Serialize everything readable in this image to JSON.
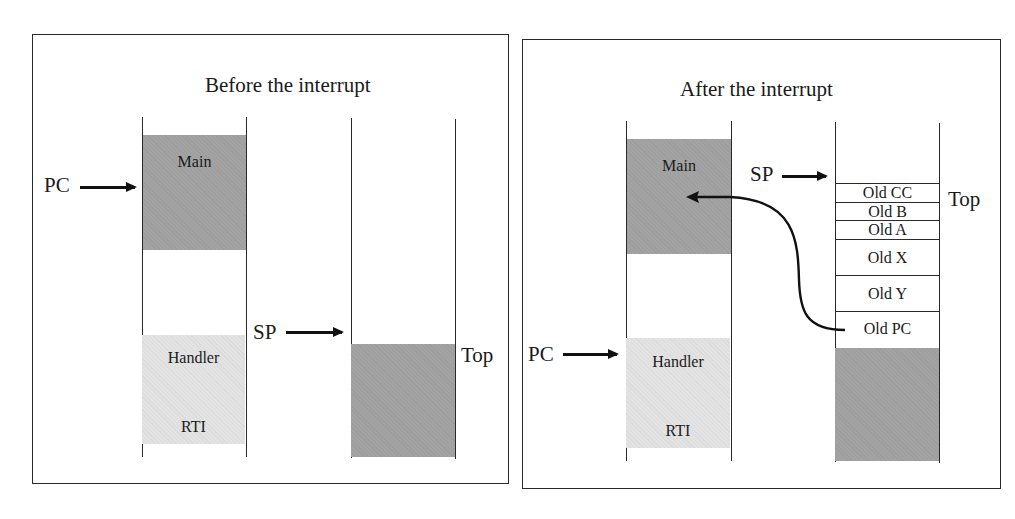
{
  "before": {
    "title": "Before the interrupt",
    "memory": {
      "main_label": "Main",
      "handler_label": "Handler",
      "rti_label": "RTI"
    },
    "pc_label": "PC",
    "sp_label": "SP",
    "stack_top_label": "Top"
  },
  "after": {
    "title": "After the interrupt",
    "memory": {
      "main_label": "Main",
      "handler_label": "Handler",
      "rti_label": "RTI"
    },
    "pc_label": "PC",
    "sp_label": "SP",
    "stack_top_label": "Top",
    "stack_frames": [
      "Old CC",
      "Old B",
      "Old A",
      "Old X",
      "Old Y",
      "Old PC"
    ]
  },
  "colors": {
    "main_block": "#a3a3a3",
    "handler_block": "#e3e3e3",
    "stack_used": "#a3a3a3",
    "line": "#2a2a2a"
  }
}
